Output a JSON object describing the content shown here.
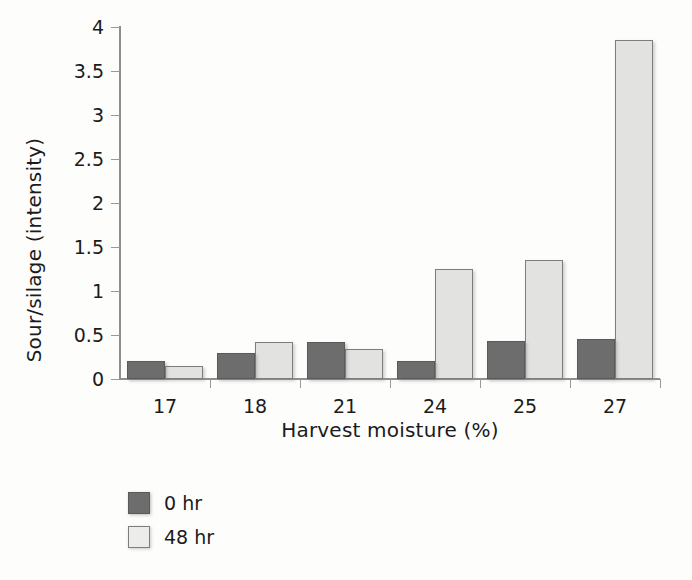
{
  "chart_data": {
    "type": "bar",
    "title": "",
    "xlabel": "Harvest moisture (%)",
    "ylabel": "Sour/silage (intensity)",
    "categories": [
      "17",
      "18",
      "21",
      "24",
      "25",
      "27"
    ],
    "series": [
      {
        "name": "0 hr",
        "color": "#6d6d6d",
        "values": [
          0.2,
          0.29,
          0.42,
          0.21,
          0.43,
          0.45
        ]
      },
      {
        "name": "48 hr",
        "color": "#e2e2e0",
        "values": [
          0.15,
          0.42,
          0.34,
          1.25,
          1.35,
          3.85
        ]
      }
    ],
    "ylim": [
      0,
      4
    ],
    "ytick_labels": [
      "0",
      "0.5",
      "1",
      "1.5",
      "2",
      "2.5",
      "3",
      "3.5",
      "4"
    ],
    "ytick_values": [
      0,
      0.5,
      1,
      1.5,
      2,
      2.5,
      3,
      3.5,
      4
    ],
    "grid": false,
    "legend_position": "below-left"
  },
  "legend": {
    "items": [
      {
        "label": "0 hr"
      },
      {
        "label": "48 hr"
      }
    ]
  }
}
